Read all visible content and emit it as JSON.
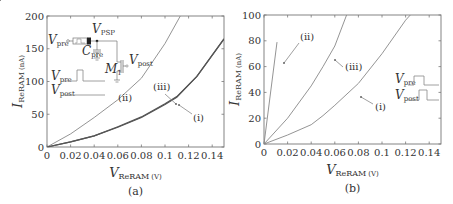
{
  "chart_data": [
    {
      "type": "line",
      "panel_label": "(a)",
      "xlabel": "V_ReRAM (V)",
      "xlabel_main": "V",
      "xlabel_sub": "ReRAM",
      "xlabel_unit": "(V)",
      "ylabel": "I_ReRAM (nA)",
      "ylabel_main": "I",
      "ylabel_sub": "ReRAM",
      "ylabel_unit": "(nA)",
      "xlim": [
        0,
        0.15
      ],
      "ylim": [
        0,
        200
      ],
      "xticks": [
        "0",
        "0.02",
        "0.04",
        "0.06",
        "0.08",
        "0.1",
        "0.12",
        "0.14"
      ],
      "yticks": [
        "0",
        "50",
        "100",
        "150",
        "200"
      ],
      "grid": false,
      "series": [
        {
          "name": "(i)",
          "x": [
            0,
            0.02,
            0.04,
            0.06,
            0.08,
            0.1,
            0.11,
            0.127,
            0.15
          ],
          "y": [
            0,
            8,
            17,
            30,
            45,
            65,
            76,
            108,
            165
          ]
        },
        {
          "name": "(ii)",
          "x": [
            0,
            0.02,
            0.04,
            0.06,
            0.08,
            0.1,
            0.113
          ],
          "y": [
            0,
            20,
            45,
            72,
            105,
            158,
            200
          ]
        },
        {
          "name": "(iii)",
          "x": [
            0,
            0.02,
            0.04,
            0.06,
            0.08,
            0.1,
            0.11,
            0.127,
            0.15
          ],
          "y": [
            0,
            8,
            17,
            31,
            46,
            66,
            77,
            108,
            165
          ]
        }
      ],
      "annotations": [
        "(i)",
        "(ii)",
        "(iii)"
      ],
      "inset": {
        "circuit_labels": {
          "v_pre": "V",
          "v_pre_sub": "pre",
          "v_psp": "V",
          "v_psp_sub": "PSP",
          "c_pre": "C",
          "c_pre_sub": "pre",
          "m1": "M",
          "m1_sub": "1",
          "v_post": "V",
          "v_post_sub": "post"
        },
        "waveform_labels": {
          "pre": "V",
          "pre_sub": "pre",
          "post": "V",
          "post_sub": "post"
        }
      }
    },
    {
      "type": "line",
      "panel_label": "(b)",
      "xlabel": "V_ReRAM (V)",
      "xlabel_main": "V",
      "xlabel_sub": "ReRAM",
      "xlabel_unit": "(V)",
      "ylabel": "I_ReRAM (nA)",
      "ylabel_main": "I",
      "ylabel_sub": "ReRAM",
      "ylabel_unit": "(nA)",
      "xlim": [
        0,
        0.15
      ],
      "ylim": [
        0,
        100
      ],
      "xticks": [
        "0",
        "0.02",
        "0.04",
        "0.06",
        "0.08",
        "0.1",
        "0.12",
        "0.14"
      ],
      "yticks": [
        "0",
        "20",
        "40",
        "60",
        "80",
        "100"
      ],
      "grid": false,
      "series": [
        {
          "name": "(i)",
          "x": [
            0,
            0.02,
            0.04,
            0.05,
            0.06,
            0.08,
            0.1,
            0.12,
            0.124
          ],
          "y": [
            0,
            7,
            15,
            22,
            30,
            47,
            70,
            96,
            100
          ]
        },
        {
          "name": "(ii)",
          "x": [
            0,
            0.011
          ],
          "y": [
            0,
            79
          ]
        },
        {
          "name": "(iii)",
          "x": [
            0,
            0.02,
            0.04,
            0.05,
            0.06,
            0.07
          ],
          "y": [
            0,
            20,
            45,
            60,
            76,
            100
          ]
        }
      ],
      "annotations": [
        "(i)",
        "(ii)",
        "(iii)"
      ],
      "inset": {
        "waveform_labels": {
          "pre": "V",
          "pre_sub": "pre",
          "post": "V",
          "post_sub": "post"
        }
      }
    }
  ]
}
